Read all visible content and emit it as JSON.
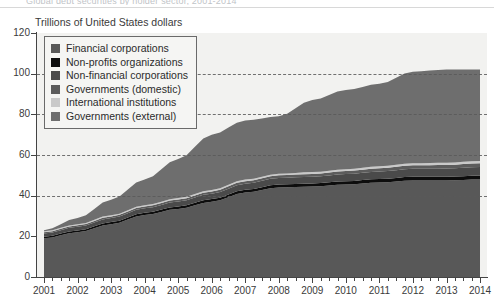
{
  "header": {
    "cut_title": "Global debt securities by holder sector, 2001-2014",
    "subtitle": "Trillions of United States dollars"
  },
  "legend": {
    "position": "top-left-inside",
    "items": [
      {
        "label": "Financial corporations",
        "color": "#585858"
      },
      {
        "label": "Non-profits organizations",
        "color": "#0d0d0d"
      },
      {
        "label": "Non-financial corporations",
        "color": "#4a4a4a"
      },
      {
        "label": "Governments (domestic)",
        "color": "#5c5c5c"
      },
      {
        "label": "International  institutions",
        "color": "#c9c9c9"
      },
      {
        "label": "Governments (external)",
        "color": "#6e6e6e"
      }
    ]
  },
  "axes": {
    "y_ticks": [
      "0",
      "20",
      "40",
      "60",
      "80",
      "100",
      "120"
    ],
    "x_ticks": [
      "2001",
      "2002",
      "2003",
      "2004",
      "2005",
      "2006",
      "2007",
      "2008",
      "2009",
      "2010",
      "2011",
      "2012",
      "2013",
      "2014"
    ]
  },
  "chart_data": {
    "type": "area",
    "stacked": true,
    "title": "Global debt securities by holder sector, 2001-2014",
    "subtitle": "Trillions of United States dollars",
    "xlabel": "",
    "ylabel": "Trillions of United States dollars",
    "ylim": [
      0,
      120
    ],
    "ytick_values": [
      0,
      20,
      40,
      60,
      80,
      100,
      120
    ],
    "grid": "horizontal-dashed",
    "legend_position": "top-left-inside",
    "x": [
      "2001",
      "2002",
      "2003",
      "2004",
      "2005",
      "2006",
      "2007",
      "2008",
      "2009",
      "2010",
      "2011",
      "2012",
      "2013",
      "2014"
    ],
    "series": [
      {
        "name": "Financial corporations",
        "color": "#585858",
        "values": [
          19.0,
          22.0,
          26.0,
          30.5,
          33.5,
          37.0,
          41.5,
          44.0,
          44.5,
          45.5,
          46.5,
          47.5,
          47.5,
          48.0
        ]
      },
      {
        "name": "Non-profits organizations",
        "color": "#0d0d0d",
        "values": [
          0.8,
          0.9,
          1.0,
          1.1,
          1.2,
          1.3,
          1.4,
          1.5,
          1.5,
          1.6,
          1.7,
          1.8,
          1.8,
          1.9
        ]
      },
      {
        "name": "Non-financial corporations",
        "color": "#4a4a4a",
        "values": [
          1.6,
          1.8,
          2.0,
          2.2,
          2.4,
          2.7,
          3.0,
          3.2,
          3.3,
          3.5,
          3.7,
          3.9,
          4.0,
          4.2
        ]
      },
      {
        "name": "Governments (domestic)",
        "color": "#5c5c5c",
        "values": [
          0.6,
          0.7,
          0.8,
          0.9,
          1.0,
          1.1,
          1.2,
          1.3,
          1.4,
          1.5,
          1.6,
          1.7,
          1.8,
          1.9
        ]
      },
      {
        "name": "International  institutions",
        "color": "#c9c9c9",
        "values": [
          0.5,
          0.5,
          0.6,
          0.6,
          0.7,
          0.7,
          0.8,
          0.8,
          0.9,
          0.9,
          1.0,
          1.0,
          1.1,
          1.1
        ]
      },
      {
        "name": "Governments (external)",
        "color": "#6e6e6e",
        "values": [
          0.5,
          3.1,
          7.6,
          12.7,
          19.2,
          27.2,
          29.1,
          28.2,
          35.4,
          39.0,
          40.5,
          45.1,
          45.8,
          44.9
        ]
      }
    ],
    "totals": [
      23.0,
      29.0,
      38.0,
      48.0,
      58.0,
      70.0,
      77.0,
      79.0,
      87.0,
      92.0,
      95.0,
      101.0,
      102.0,
      102.0
    ],
    "notes": [
      "Total stacked value rises from about 23 trillion in 2001 to about 102 trillion in 2014.",
      "Local peak near 80 trillion around 2008, brief dip in 2009 before resuming growth.",
      "A thin light band (International institutions) is visible as a pale line across the stack."
    ]
  }
}
